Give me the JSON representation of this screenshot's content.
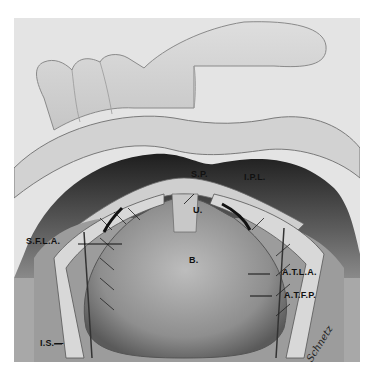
{
  "figure": {
    "labels": {
      "sp": "S.P.",
      "ipl": "I.P.L.",
      "u": "U.",
      "b": "B.",
      "sfla": "S.F.L.A.",
      "atla": "A.T.L.A.",
      "atfp": "A.T.F.P.",
      "is": "I.S.—"
    },
    "signature": "Schnetz"
  },
  "colors": {
    "background": "#ffffff",
    "panel": "#e4e4e4",
    "cavity": "#2e2e2e",
    "tissue": "#9a9a9a",
    "ink": "#111111"
  }
}
